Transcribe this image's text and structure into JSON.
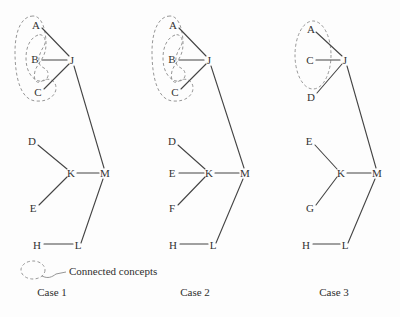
{
  "figure": {
    "background_color": "#fdfdfd",
    "edge_color": "#444444",
    "region_color": "#8a8a8a",
    "text_color": "#2f2f2f"
  },
  "legend": {
    "label": "Connected concepts",
    "marker_name": "dashed-ellipse"
  },
  "captions": {
    "case1": "Case 1",
    "case2": "Case 2",
    "case3": "Case 3"
  },
  "cases": [
    {
      "id": "case1",
      "caption": "Case 1",
      "nodes": [
        {
          "id": "A",
          "label": "A",
          "x": 36,
          "y": 25
        },
        {
          "id": "B",
          "label": "B",
          "x": 35,
          "y": 59
        },
        {
          "id": "C",
          "label": "C",
          "x": 38,
          "y": 92
        },
        {
          "id": "J",
          "label": "J",
          "x": 72,
          "y": 60
        },
        {
          "id": "D",
          "label": "D",
          "x": 32,
          "y": 141
        },
        {
          "id": "E",
          "label": "E",
          "x": 33,
          "y": 208
        },
        {
          "id": "K",
          "label": "K",
          "x": 71,
          "y": 173
        },
        {
          "id": "M",
          "label": "M",
          "x": 105,
          "y": 173
        },
        {
          "id": "H",
          "label": "H",
          "x": 37,
          "y": 245
        },
        {
          "id": "L",
          "label": "L",
          "x": 78,
          "y": 245
        }
      ],
      "edges": [
        {
          "from": "A",
          "to": "J"
        },
        {
          "from": "B",
          "to": "J"
        },
        {
          "from": "C",
          "to": "J"
        },
        {
          "from": "J",
          "to": "M"
        },
        {
          "from": "D",
          "to": "K"
        },
        {
          "from": "E",
          "to": "K"
        },
        {
          "from": "K",
          "to": "M"
        },
        {
          "from": "M",
          "to": "L"
        },
        {
          "from": "H",
          "to": "L"
        }
      ],
      "connected_group": [
        "A",
        "B",
        "C"
      ]
    },
    {
      "id": "case2",
      "caption": "Case 2",
      "nodes": [
        {
          "id": "A",
          "label": "A",
          "x": 173,
          "y": 25
        },
        {
          "id": "B",
          "label": "B",
          "x": 172,
          "y": 59
        },
        {
          "id": "C",
          "label": "C",
          "x": 175,
          "y": 92
        },
        {
          "id": "J",
          "label": "J",
          "x": 209,
          "y": 60
        },
        {
          "id": "D",
          "label": "D",
          "x": 172,
          "y": 141
        },
        {
          "id": "E",
          "label": "E",
          "x": 172,
          "y": 173
        },
        {
          "id": "F",
          "label": "F",
          "x": 172,
          "y": 208
        },
        {
          "id": "K",
          "label": "K",
          "x": 209,
          "y": 173
        },
        {
          "id": "M",
          "label": "M",
          "x": 245,
          "y": 173
        },
        {
          "id": "H",
          "label": "H",
          "x": 173,
          "y": 245
        },
        {
          "id": "L",
          "label": "L",
          "x": 213,
          "y": 245
        }
      ],
      "edges": [
        {
          "from": "A",
          "to": "J"
        },
        {
          "from": "B",
          "to": "J"
        },
        {
          "from": "C",
          "to": "J"
        },
        {
          "from": "J",
          "to": "M"
        },
        {
          "from": "D",
          "to": "K"
        },
        {
          "from": "E",
          "to": "K"
        },
        {
          "from": "F",
          "to": "K"
        },
        {
          "from": "K",
          "to": "M"
        },
        {
          "from": "M",
          "to": "L"
        },
        {
          "from": "H",
          "to": "L"
        }
      ],
      "connected_group": [
        "A",
        "B",
        "C"
      ]
    },
    {
      "id": "case3",
      "caption": "Case 3",
      "nodes": [
        {
          "id": "A",
          "label": "A",
          "x": 311,
          "y": 29
        },
        {
          "id": "C",
          "label": "C",
          "x": 310,
          "y": 60
        },
        {
          "id": "D",
          "label": "D",
          "x": 311,
          "y": 97
        },
        {
          "id": "J",
          "label": "J",
          "x": 345,
          "y": 60
        },
        {
          "id": "E",
          "label": "E",
          "x": 309,
          "y": 141
        },
        {
          "id": "G",
          "label": "G",
          "x": 310,
          "y": 208
        },
        {
          "id": "K",
          "label": "K",
          "x": 341,
          "y": 173
        },
        {
          "id": "M",
          "label": "M",
          "x": 377,
          "y": 173
        },
        {
          "id": "H",
          "label": "H",
          "x": 306,
          "y": 245
        },
        {
          "id": "L",
          "label": "L",
          "x": 345,
          "y": 245
        }
      ],
      "edges": [
        {
          "from": "A",
          "to": "J"
        },
        {
          "from": "C",
          "to": "J"
        },
        {
          "from": "D",
          "to": "J"
        },
        {
          "from": "J",
          "to": "M"
        },
        {
          "from": "E",
          "to": "K"
        },
        {
          "from": "G",
          "to": "K"
        },
        {
          "from": "K",
          "to": "M"
        },
        {
          "from": "M",
          "to": "L"
        },
        {
          "from": "H",
          "to": "L"
        }
      ],
      "connected_group": [
        "A",
        "C"
      ]
    }
  ]
}
